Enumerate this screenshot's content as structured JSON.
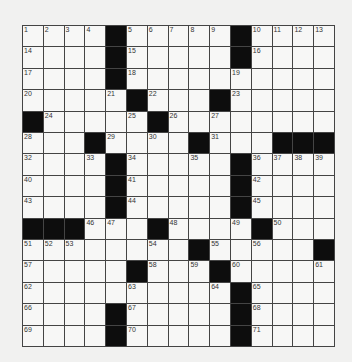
{
  "puzzle": {
    "rows": 15,
    "cols": 15,
    "colors": {
      "background": "#f1f1f0",
      "cell": "#f7f7f6",
      "block": "#0d0d0d",
      "gridline": "#444444",
      "number": "#333333"
    },
    "layout": [
      [
        "1",
        "2",
        "3",
        "4",
        "#",
        "5",
        "6",
        "7",
        "8",
        "9",
        "#",
        "10",
        "11",
        "12",
        "13"
      ],
      [
        "14",
        "",
        "",
        "",
        "#",
        "15",
        "",
        "",
        "",
        "",
        "#",
        "16",
        "",
        "",
        ""
      ],
      [
        "17",
        "",
        "",
        "",
        "#",
        "18",
        "",
        "",
        "",
        "",
        "19",
        "",
        "",
        "",
        ""
      ],
      [
        "20",
        "",
        "",
        "",
        "21",
        "#",
        "22",
        "",
        "",
        "#",
        "23",
        "",
        "",
        "",
        ""
      ],
      [
        "#",
        "24",
        "",
        "",
        "",
        "25",
        "#",
        "26",
        "",
        "27",
        "",
        "",
        "",
        "",
        ""
      ],
      [
        "28",
        "",
        "",
        "#",
        "29",
        "",
        "30",
        "",
        "#",
        "31",
        "",
        "",
        "#",
        "#",
        "#"
      ],
      [
        "32",
        "",
        "",
        "33",
        "#",
        "34",
        "",
        "",
        "35",
        "",
        "#",
        "36",
        "37",
        "38",
        "39"
      ],
      [
        "40",
        "",
        "",
        "",
        "#",
        "41",
        "",
        "",
        "",
        "",
        "#",
        "42",
        "",
        "",
        ""
      ],
      [
        "43",
        "",
        "",
        "",
        "#",
        "44",
        "",
        "",
        "",
        "",
        "#",
        "45",
        "",
        "",
        ""
      ],
      [
        "#",
        "#",
        "#",
        "46",
        "47",
        "",
        "#",
        "48",
        "",
        "",
        "49",
        "#",
        "50",
        "",
        ""
      ],
      [
        "51",
        "52",
        "53",
        "",
        "",
        "",
        "54",
        "",
        "#",
        "55",
        "",
        "56",
        "",
        "",
        "#"
      ],
      [
        "57",
        "",
        "",
        "",
        "",
        "#",
        "58",
        "",
        "59",
        "#",
        "60",
        "",
        "",
        "",
        "61"
      ],
      [
        "62",
        "",
        "",
        "",
        "",
        "63",
        "",
        "",
        "",
        "64",
        "#",
        "65",
        "",
        "",
        ""
      ],
      [
        "66",
        "",
        "",
        "",
        "#",
        "67",
        "",
        "",
        "",
        "",
        "#",
        "68",
        "",
        "",
        ""
      ],
      [
        "69",
        "",
        "",
        "",
        "#",
        "70",
        "",
        "",
        "",
        "",
        "#",
        "71",
        "",
        "",
        ""
      ]
    ]
  }
}
